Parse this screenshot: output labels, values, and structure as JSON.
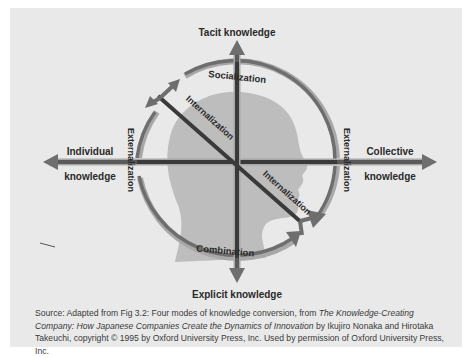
{
  "diagram": {
    "title": "Four modes of knowledge conversion",
    "axes": {
      "top": "Tacit knowledge",
      "bottom": "Explicit knowledge",
      "left_line1": "Individual",
      "left_line2": "knowledge",
      "right_line1": "Collective",
      "right_line2": "knowledge"
    },
    "modes": {
      "socialization": "Socialization",
      "externalization_left": "Externalization",
      "externalization_right": "Externalization",
      "combination": "Combination",
      "internalization_upper": "Internalization",
      "internalization_lower": "Internalization"
    },
    "colors": {
      "background": "#e9e9e9",
      "arrow": "#6e6e6e",
      "arrow_highlight": "#a8a8a8",
      "axis_dark": "#3a3a3a",
      "head": "#bdbdbd",
      "text": "#2a2a2a"
    }
  },
  "caption": {
    "prefix": "Source: Adapted from Fig 3.2: Four modes of knowledge conversion, from ",
    "book_title": "The Knowledge-Creating Company: How Japanese Companies Create the Dynamics of Innovation",
    "suffix": " by Ikujiro Nonaka and Hirotaka Takeuchi, copyright © 1995 by Oxford University Press, Inc. Used by permission of Oxford University Press, Inc."
  }
}
